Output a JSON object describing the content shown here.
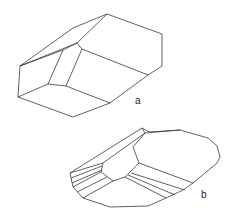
{
  "figure": {
    "crystals": [
      {
        "id": "a",
        "label": "a",
        "outline": [
          [
            107,
            14
          ],
          [
            162,
            34
          ],
          [
            162,
            66
          ],
          [
            148,
            75
          ],
          [
            110,
            103
          ],
          [
            73,
            117
          ],
          [
            18,
            97
          ],
          [
            20,
            66
          ],
          [
            73,
            28
          ]
        ],
        "edges": [
          [
            [
              20,
              66
            ],
            [
              77,
              43
            ],
            [
              107,
              14
            ]
          ],
          [
            [
              77,
              43
            ],
            [
              82,
              49
            ],
            [
              148,
              75
            ]
          ],
          [
            [
              82,
              49
            ],
            [
              66,
              86
            ],
            [
              110,
              103
            ]
          ],
          [
            [
              77,
              43
            ],
            [
              63,
              50
            ],
            [
              48,
              84
            ],
            [
              18,
              97
            ]
          ],
          [
            [
              48,
              84
            ],
            [
              66,
              86
            ]
          ],
          [
            [
              20,
              66
            ],
            [
              63,
              50
            ]
          ]
        ]
      },
      {
        "id": "b",
        "label": "b",
        "outline": [
          [
            142,
            128
          ],
          [
            149,
            132
          ],
          [
            180,
            130
          ],
          [
            208,
            138
          ],
          [
            217,
            146
          ],
          [
            220,
            157
          ],
          [
            217,
            163
          ],
          [
            193,
            183
          ],
          [
            183,
            190
          ],
          [
            166,
            198
          ],
          [
            148,
            206
          ],
          [
            110,
            207
          ],
          [
            83,
            198
          ],
          [
            73,
            187
          ],
          [
            70,
            173
          ]
        ],
        "edges": [
          [
            [
              142,
              128
            ],
            [
              145,
              133
            ],
            [
              180,
              130
            ]
          ],
          [
            [
              145,
              133
            ],
            [
              103,
              163
            ],
            [
              70,
              173
            ]
          ],
          [
            [
              145,
              133
            ],
            [
              133,
              147
            ],
            [
              139,
              163
            ]
          ],
          [
            [
              103,
              163
            ],
            [
              101,
              172
            ],
            [
              113,
              181
            ],
            [
              125,
              177
            ],
            [
              139,
              163
            ]
          ],
          [
            [
              139,
              163
            ],
            [
              193,
              183
            ]
          ],
          [
            [
              125,
              177
            ],
            [
              166,
              198
            ]
          ],
          [
            [
              101,
              172
            ],
            [
              73,
              187
            ]
          ],
          [
            [
              113,
              181
            ],
            [
              83,
              198
            ]
          ]
        ],
        "bands": [
          [
            [
              71,
              178
            ],
            [
              102,
              166
            ]
          ],
          [
            [
              72,
              183
            ],
            [
              102,
              170
            ]
          ],
          [
            [
              77,
              192
            ],
            [
              107,
              177
            ]
          ],
          [
            [
              131,
              173
            ],
            [
              185,
              190
            ]
          ],
          [
            [
              128,
              175
            ],
            [
              175,
              195
            ]
          ]
        ]
      }
    ]
  }
}
